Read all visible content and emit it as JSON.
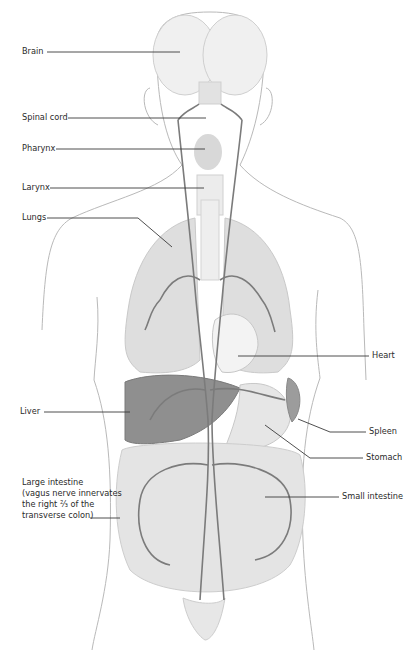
{
  "diagram": {
    "colors": {
      "outline": "#b5b5b5",
      "organ_fill": "#e4e4e4",
      "lung_fill": "#dcdcdc",
      "liver_fill": "#8c8c8c",
      "nerve": "#7a7a7a",
      "leader_line": "#3a3a3a",
      "text": "#2b2b2b"
    },
    "labels_left": [
      {
        "text": "Brain"
      },
      {
        "text": "Spinal cord"
      },
      {
        "text": "Pharynx"
      },
      {
        "text": "Larynx"
      },
      {
        "text": "Lungs"
      },
      {
        "text": "Liver"
      },
      {
        "text": "Large intestine\n(vagus nerve innervates\nthe right ⅔ of the\ntransverse colon)"
      }
    ],
    "labels_right": [
      {
        "text": "Heart"
      },
      {
        "text": "Spleen"
      },
      {
        "text": "Stomach"
      },
      {
        "text": "Small intestine"
      }
    ]
  }
}
